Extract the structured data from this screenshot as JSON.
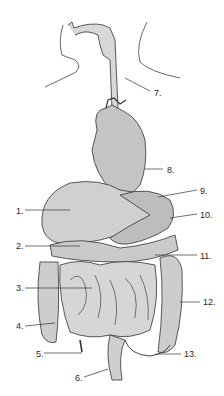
{
  "diagram": {
    "colors": {
      "ink": "#2a2a2a",
      "organ_fill": "#cfcfcf",
      "background": "#ffffff"
    },
    "labels": [
      {
        "id": "1",
        "text": "1.",
        "x": 16,
        "y": 206
      },
      {
        "id": "2",
        "text": "2.",
        "x": 16,
        "y": 241
      },
      {
        "id": "3",
        "text": "3.",
        "x": 16,
        "y": 283
      },
      {
        "id": "4",
        "text": "4.",
        "x": 16,
        "y": 321
      },
      {
        "id": "5",
        "text": "5.",
        "x": 36,
        "y": 349
      },
      {
        "id": "6",
        "text": "6.",
        "x": 75,
        "y": 373
      },
      {
        "id": "7",
        "text": "7.",
        "x": 154,
        "y": 88
      },
      {
        "id": "8",
        "text": "8.",
        "x": 167,
        "y": 165
      },
      {
        "id": "9",
        "text": "9.",
        "x": 200,
        "y": 186
      },
      {
        "id": "10",
        "text": "10.",
        "x": 200,
        "y": 210
      },
      {
        "id": "11",
        "text": "11.",
        "x": 200,
        "y": 251
      },
      {
        "id": "12",
        "text": "12.",
        "x": 203,
        "y": 297
      },
      {
        "id": "13",
        "text": "13.",
        "x": 184,
        "y": 349
      }
    ]
  }
}
